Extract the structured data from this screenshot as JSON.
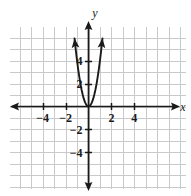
{
  "figure": {
    "background_color": "#ffffff",
    "width": 191,
    "height": 196
  },
  "chart_data": {
    "type": "line",
    "title": "",
    "subtitle": "",
    "xlabel": "x",
    "ylabel": "y",
    "xlim": [
      -6.8,
      8.4
    ],
    "ylim": [
      -7.2,
      6.8
    ],
    "grid": true,
    "grid_color": "#c9cacb",
    "grid_step": 1,
    "axis_color": "#1a1a1a",
    "curve_color": "#1a1a1a",
    "legend": null,
    "legend_position": "none",
    "annotations": [],
    "xticks": [
      -4,
      -2,
      2,
      4
    ],
    "xtick_labels": [
      "−4",
      "−2",
      "2",
      "4"
    ],
    "yticks": [
      4,
      2,
      -2,
      -4
    ],
    "ytick_labels": [
      "4",
      "2",
      "−2",
      "−4"
    ],
    "series": [
      {
        "name": "parabola",
        "equation": "y = 4x^2",
        "vertex": [
          0,
          0
        ],
        "opens": "up",
        "arrowheads": [
          "left-arm-up",
          "right-arm-up"
        ],
        "x": [
          -1.22,
          -1.1,
          -1.0,
          -0.9,
          -0.8,
          -0.7,
          -0.6,
          -0.5,
          -0.4,
          -0.3,
          -0.2,
          -0.1,
          0,
          0.1,
          0.2,
          0.3,
          0.4,
          0.5,
          0.6,
          0.7,
          0.8,
          0.9,
          1.0,
          1.1,
          1.22
        ],
        "y": [
          5.95,
          4.84,
          4.0,
          3.24,
          2.56,
          1.96,
          1.44,
          1.0,
          0.64,
          0.36,
          0.16,
          0.04,
          0,
          0.04,
          0.16,
          0.36,
          0.64,
          1.0,
          1.44,
          1.96,
          2.56,
          3.24,
          4.0,
          4.84,
          5.95
        ]
      }
    ]
  },
  "axes": {
    "x_axis_name": "x",
    "y_axis_name": "y",
    "x_arrow_left": true,
    "x_arrow_right": true,
    "y_arrow_top": true,
    "y_arrow_bottom": true
  }
}
